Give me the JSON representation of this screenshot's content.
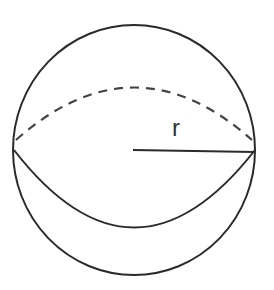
{
  "figure": {
    "type": "sphere",
    "label": "r",
    "stroke_color": "#2a2a2a"
  }
}
